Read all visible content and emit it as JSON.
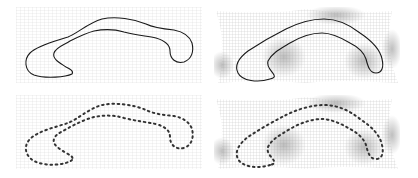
{
  "figure": {
    "colors": {
      "background": "#ffffff",
      "grid": "#c8c8c8",
      "grid_dense": "#9a9a9a",
      "contour": "#1a1a1a",
      "points": "#333333"
    },
    "panels": [
      {
        "id": "top-left",
        "content": "continuous contour",
        "grid": "regular"
      },
      {
        "id": "top-right",
        "content": "continuous contour",
        "grid": "deformed"
      },
      {
        "id": "bottom-left",
        "content": "dotted landmark points",
        "grid": "regular"
      },
      {
        "id": "bottom-right",
        "content": "dotted landmark points",
        "grid": "deformed"
      }
    ]
  }
}
